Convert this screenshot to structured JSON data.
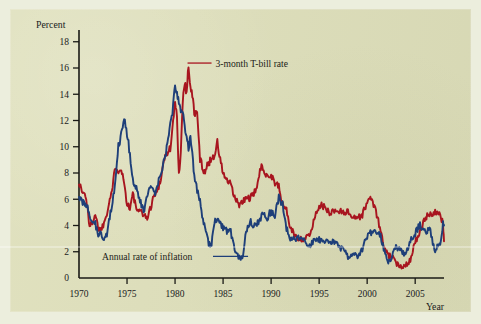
{
  "figure": {
    "background_color": "#dedfba",
    "outer_color": "#eceedd",
    "axis_color": "#1a1a16"
  },
  "chart_data": {
    "type": "line",
    "title": "",
    "xlabel": "Year",
    "ylabel": "Percent",
    "xlim": [
      1970,
      2008
    ],
    "ylim": [
      0,
      19
    ],
    "grid": false,
    "legend_position": "inline-annotations",
    "x_ticks": [
      1970,
      1975,
      1980,
      1985,
      1990,
      1995,
      2000,
      2005
    ],
    "y_ticks": [
      0,
      2,
      4,
      6,
      8,
      10,
      12,
      14,
      16,
      18
    ],
    "annotations": [
      {
        "text": "3-month T-bill rate",
        "series": "3-month T-bill rate",
        "color": "#a8151f",
        "point_x": 1981.3,
        "point_y": 16.3
      },
      {
        "text": "Annual rate of inflation",
        "series": "Annual rate of inflation",
        "color": "#1e3f79",
        "point_x": 1987.6,
        "point_y": 1.6
      }
    ],
    "series": [
      {
        "name": "3-month T-bill rate",
        "color": "#a8151f",
        "x": [
          1970.0,
          1970.3,
          1970.6,
          1970.9,
          1971.1,
          1971.4,
          1971.7,
          1972.0,
          1972.3,
          1972.6,
          1972.9,
          1973.2,
          1973.5,
          1973.8,
          1974.1,
          1974.4,
          1974.7,
          1975.0,
          1975.3,
          1975.6,
          1975.9,
          1976.2,
          1976.5,
          1976.8,
          1977.1,
          1977.4,
          1977.7,
          1978.0,
          1978.3,
          1978.6,
          1978.9,
          1979.2,
          1979.5,
          1979.8,
          1980.0,
          1980.2,
          1980.4,
          1980.6,
          1980.8,
          1981.0,
          1981.2,
          1981.4,
          1981.6,
          1981.8,
          1982.0,
          1982.3,
          1982.6,
          1982.9,
          1983.2,
          1983.5,
          1983.8,
          1984.1,
          1984.4,
          1984.7,
          1985.0,
          1985.4,
          1985.8,
          1986.2,
          1986.6,
          1987.0,
          1987.4,
          1987.8,
          1988.2,
          1988.6,
          1989.0,
          1989.3,
          1989.6,
          1990.0,
          1990.4,
          1990.8,
          1991.2,
          1991.6,
          1992.0,
          1992.5,
          1993.0,
          1993.5,
          1994.0,
          1994.5,
          1995.0,
          1995.5,
          1996.0,
          1996.5,
          1997.0,
          1997.5,
          1998.0,
          1998.5,
          1999.0,
          1999.5,
          2000.0,
          2000.5,
          2001.0,
          2001.4,
          2001.8,
          2002.2,
          2002.6,
          2003.0,
          2003.5,
          2004.0,
          2004.5,
          2005.0,
          2005.5,
          2006.0,
          2006.5,
          2007.0,
          2007.3,
          2007.6,
          2007.9,
          2008.0
        ],
        "y": [
          7.3,
          6.6,
          6.4,
          5.4,
          3.8,
          4.3,
          4.9,
          3.8,
          3.7,
          4.2,
          5.0,
          6.0,
          6.9,
          8.6,
          8.2,
          8.4,
          7.2,
          5.7,
          5.3,
          6.4,
          5.5,
          4.9,
          5.2,
          4.7,
          4.6,
          5.2,
          6.1,
          6.4,
          7.0,
          7.9,
          9.2,
          9.5,
          9.9,
          11.8,
          13.5,
          12.1,
          8.0,
          9.5,
          13.6,
          15.0,
          14.0,
          16.3,
          14.5,
          13.9,
          12.6,
          12.5,
          9.1,
          8.3,
          8.2,
          8.8,
          9.1,
          9.4,
          10.3,
          9.0,
          8.0,
          7.4,
          7.1,
          6.1,
          5.6,
          5.7,
          6.1,
          6.1,
          6.3,
          7.3,
          8.5,
          8.2,
          7.8,
          7.8,
          7.3,
          6.9,
          5.6,
          5.2,
          3.8,
          3.2,
          3.0,
          3.0,
          3.2,
          4.5,
          5.6,
          5.4,
          5.0,
          5.1,
          5.1,
          5.1,
          5.0,
          4.7,
          4.6,
          4.8,
          5.8,
          6.1,
          4.8,
          3.6,
          2.2,
          1.7,
          1.6,
          1.1,
          0.9,
          1.0,
          1.4,
          2.8,
          3.4,
          4.5,
          4.9,
          5.0,
          4.9,
          4.7,
          4.2,
          2.8
        ]
      },
      {
        "name": "Annual rate of inflation",
        "color": "#1e3f79",
        "x": [
          1970.0,
          1970.3,
          1970.6,
          1970.9,
          1971.1,
          1971.4,
          1971.7,
          1972.0,
          1972.3,
          1972.6,
          1972.9,
          1973.2,
          1973.5,
          1973.8,
          1974.1,
          1974.4,
          1974.7,
          1975.0,
          1975.3,
          1975.6,
          1975.9,
          1976.2,
          1976.5,
          1976.8,
          1977.1,
          1977.4,
          1977.7,
          1978.0,
          1978.3,
          1978.6,
          1978.9,
          1979.2,
          1979.5,
          1979.8,
          1980.0,
          1980.2,
          1980.4,
          1980.6,
          1980.8,
          1981.0,
          1981.2,
          1981.4,
          1981.6,
          1981.8,
          1982.0,
          1982.3,
          1982.6,
          1982.9,
          1983.2,
          1983.5,
          1983.8,
          1984.1,
          1984.4,
          1984.7,
          1985.0,
          1985.4,
          1985.8,
          1986.2,
          1986.6,
          1987.0,
          1987.4,
          1987.8,
          1988.2,
          1988.6,
          1989.0,
          1989.3,
          1989.6,
          1990.0,
          1990.4,
          1990.8,
          1991.2,
          1991.6,
          1992.0,
          1992.5,
          1993.0,
          1993.5,
          1994.0,
          1994.5,
          1995.0,
          1995.5,
          1996.0,
          1996.5,
          1997.0,
          1997.5,
          1998.0,
          1998.5,
          1999.0,
          1999.5,
          2000.0,
          2000.5,
          2001.0,
          2001.4,
          2001.8,
          2002.2,
          2002.6,
          2003.0,
          2003.5,
          2004.0,
          2004.5,
          2005.0,
          2005.5,
          2006.0,
          2006.5,
          2007.0,
          2007.3,
          2007.6,
          2007.9,
          2008.0
        ],
        "y": [
          6.0,
          5.9,
          5.6,
          5.5,
          4.8,
          4.4,
          4.1,
          3.3,
          3.4,
          2.9,
          3.4,
          4.6,
          6.0,
          7.4,
          10.0,
          11.0,
          12.2,
          11.0,
          9.4,
          7.5,
          7.0,
          6.2,
          5.6,
          5.0,
          6.4,
          6.8,
          6.6,
          6.5,
          7.4,
          8.0,
          9.0,
          10.1,
          11.6,
          13.0,
          14.6,
          14.0,
          13.5,
          12.6,
          12.5,
          11.6,
          10.6,
          10.0,
          10.8,
          9.6,
          7.6,
          6.7,
          5.9,
          4.5,
          3.7,
          2.6,
          2.6,
          4.2,
          4.5,
          4.3,
          3.8,
          3.6,
          3.5,
          2.2,
          1.6,
          1.5,
          3.6,
          4.3,
          4.0,
          4.2,
          4.7,
          5.0,
          4.6,
          5.1,
          4.8,
          6.1,
          5.6,
          3.8,
          3.0,
          3.0,
          3.1,
          2.8,
          2.5,
          2.8,
          2.9,
          2.7,
          2.7,
          2.9,
          2.4,
          2.2,
          1.6,
          1.7,
          1.7,
          2.2,
          3.2,
          3.5,
          3.4,
          3.2,
          2.0,
          1.2,
          1.6,
          2.4,
          2.1,
          1.8,
          2.9,
          3.4,
          4.1,
          3.5,
          3.8,
          2.1,
          2.4,
          2.7,
          4.1,
          4.0
        ]
      }
    ]
  },
  "labels": {
    "y_axis_title": "Percent",
    "x_axis_title": "Year",
    "tbill_annotation": "3-month T-bill rate",
    "inflation_annotation": "Annual rate of inflation",
    "y_ticks": [
      "0",
      "2",
      "4",
      "6",
      "8",
      "10",
      "12",
      "14",
      "16",
      "18"
    ],
    "x_ticks": [
      "1970",
      "1975",
      "1980",
      "1985",
      "1990",
      "1995",
      "2000",
      "2005"
    ]
  }
}
